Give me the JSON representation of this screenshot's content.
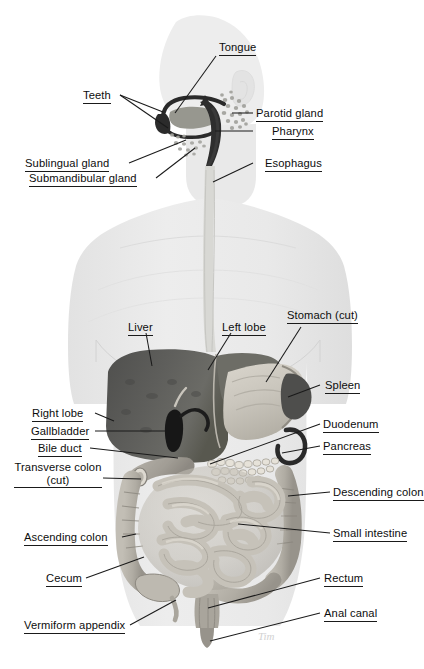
{
  "figure": {
    "background_color": "#ffffff",
    "body_silhouette_color": "#e8e8e8",
    "liver_color": "#5a5a58",
    "stomach_color": "#c9c5bd",
    "intestine_color": "#b5b1a8",
    "label_color": "#0d0d0d",
    "leader_line_color": "#1a1a1a",
    "signature": "Tim"
  },
  "labels": {
    "tongue": "Tongue",
    "teeth": "Teeth",
    "parotid_gland": "Parotid gland",
    "pharynx": "Pharynx",
    "sublingual_gland": "Sublingual gland",
    "submandibular_gland": "Submandibular gland",
    "esophagus": "Esophagus",
    "liver": "Liver",
    "left_lobe": "Left lobe",
    "stomach_cut": "Stomach (cut)",
    "spleen": "Spleen",
    "right_lobe": "Right lobe",
    "gallbladder": "Gallbladder",
    "bile_duct": "Bile duct",
    "duodenum": "Duodenum",
    "pancreas": "Pancreas",
    "transverse_colon_line1": "Transverse colon",
    "transverse_colon_line2": "(cut)",
    "descending_colon": "Descending colon",
    "ascending_colon": "Ascending colon",
    "small_intestine": "Small intestine",
    "cecum": "Cecum",
    "rectum": "Rectum",
    "anal_canal": "Anal canal",
    "vermiform_appendix": "Vermiform appendix"
  }
}
